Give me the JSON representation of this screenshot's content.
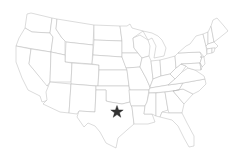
{
  "map": {
    "region": "Contiguous United States",
    "style": "state outlines, light gray on white",
    "stroke_color": "#b8b8b8",
    "background": "#ffffff"
  },
  "marker": {
    "icon": "star-icon",
    "location": "North Texas",
    "x": 117,
    "y": 112,
    "color": "#333333"
  }
}
